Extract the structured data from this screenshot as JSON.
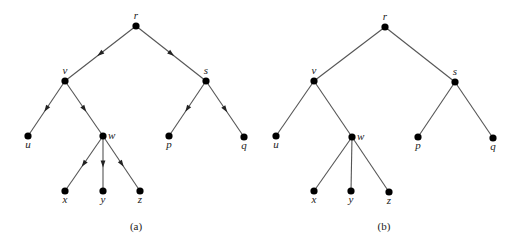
{
  "figure": {
    "trees": [
      {
        "id": "a",
        "caption": "(a)",
        "directed": true,
        "caption_pos": [
          136,
          230
        ],
        "nodes": [
          {
            "id": "r",
            "label": "r",
            "x": 136,
            "y": 26,
            "lx": 136,
            "ly": 19,
            "anchor": "middle"
          },
          {
            "id": "v",
            "label": "v",
            "x": 65,
            "y": 81,
            "lx": 65,
            "ly": 74,
            "anchor": "middle"
          },
          {
            "id": "s",
            "label": "s",
            "x": 206,
            "y": 81,
            "lx": 206,
            "ly": 74,
            "anchor": "middle"
          },
          {
            "id": "u",
            "label": "u",
            "x": 28,
            "y": 136,
            "lx": 28,
            "ly": 148,
            "anchor": "middle"
          },
          {
            "id": "w",
            "label": "w",
            "x": 103,
            "y": 136,
            "lx": 108,
            "ly": 139,
            "anchor": "start"
          },
          {
            "id": "p",
            "label": "p",
            "x": 169,
            "y": 136,
            "lx": 169,
            "ly": 148,
            "anchor": "middle"
          },
          {
            "id": "q",
            "label": "q",
            "x": 244,
            "y": 137,
            "lx": 244,
            "ly": 149,
            "anchor": "middle"
          },
          {
            "id": "x",
            "label": "x",
            "x": 65,
            "y": 191,
            "lx": 65,
            "ly": 203,
            "anchor": "middle"
          },
          {
            "id": "y",
            "label": "y",
            "x": 103,
            "y": 191,
            "lx": 103,
            "ly": 203,
            "anchor": "middle"
          },
          {
            "id": "z",
            "label": "z",
            "x": 140,
            "y": 191,
            "lx": 140,
            "ly": 203,
            "anchor": "middle"
          }
        ],
        "edges": [
          [
            "r",
            "v"
          ],
          [
            "r",
            "s"
          ],
          [
            "v",
            "u"
          ],
          [
            "v",
            "w"
          ],
          [
            "s",
            "p"
          ],
          [
            "s",
            "q"
          ],
          [
            "w",
            "x"
          ],
          [
            "w",
            "y"
          ],
          [
            "w",
            "z"
          ]
        ]
      },
      {
        "id": "b",
        "caption": "(b)",
        "directed": false,
        "caption_pos": [
          384,
          230
        ],
        "nodes": [
          {
            "id": "r",
            "label": "r",
            "x": 385,
            "y": 27,
            "lx": 385,
            "ly": 20,
            "anchor": "middle"
          },
          {
            "id": "v",
            "label": "v",
            "x": 314,
            "y": 81,
            "lx": 314,
            "ly": 74,
            "anchor": "middle"
          },
          {
            "id": "s",
            "label": "s",
            "x": 455,
            "y": 82,
            "lx": 455,
            "ly": 75,
            "anchor": "middle"
          },
          {
            "id": "u",
            "label": "u",
            "x": 276,
            "y": 136,
            "lx": 276,
            "ly": 148,
            "anchor": "middle"
          },
          {
            "id": "w",
            "label": "w",
            "x": 352,
            "y": 137,
            "lx": 357,
            "ly": 140,
            "anchor": "start"
          },
          {
            "id": "p",
            "label": "p",
            "x": 418,
            "y": 137,
            "lx": 418,
            "ly": 149,
            "anchor": "middle"
          },
          {
            "id": "q",
            "label": "q",
            "x": 493,
            "y": 138,
            "lx": 493,
            "ly": 150,
            "anchor": "middle"
          },
          {
            "id": "x",
            "label": "x",
            "x": 314,
            "y": 191,
            "lx": 314,
            "ly": 203,
            "anchor": "middle"
          },
          {
            "id": "y",
            "label": "y",
            "x": 351,
            "y": 191,
            "lx": 351,
            "ly": 203,
            "anchor": "middle"
          },
          {
            "id": "z",
            "label": "z",
            "x": 389,
            "y": 192,
            "lx": 389,
            "ly": 204,
            "anchor": "middle"
          }
        ],
        "edges": [
          [
            "r",
            "v"
          ],
          [
            "r",
            "s"
          ],
          [
            "v",
            "u"
          ],
          [
            "v",
            "w"
          ],
          [
            "s",
            "p"
          ],
          [
            "s",
            "q"
          ],
          [
            "w",
            "x"
          ],
          [
            "w",
            "y"
          ],
          [
            "w",
            "z"
          ]
        ]
      }
    ]
  }
}
